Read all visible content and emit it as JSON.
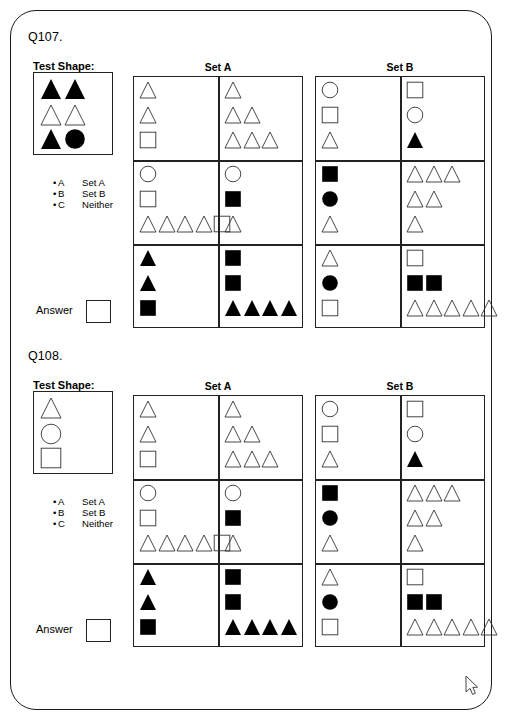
{
  "page": {
    "cursor": {
      "name": "mouse-pointer",
      "x": 466,
      "y": 676
    }
  },
  "shape_palette": {
    "outline_stroke": "#333333",
    "fill_color": "#000000"
  },
  "questions": [
    {
      "id": "q107",
      "label": "Q107.",
      "test_shape_label": "Test Shape:",
      "set_a_label": "Set A",
      "set_b_label": "Set B",
      "answer_label": "Answer",
      "options": [
        {
          "bullet": "•",
          "key": "A",
          "value": "Set A"
        },
        {
          "bullet": "•",
          "key": "B",
          "value": "Set B"
        },
        {
          "bullet": "•",
          "key": "C",
          "value": "Neither"
        }
      ],
      "test_shape_rows": [
        [
          {
            "shape": "triangle",
            "fill": "solid"
          },
          {
            "shape": "triangle",
            "fill": "solid"
          }
        ],
        [
          {
            "shape": "triangle",
            "fill": "outline"
          },
          {
            "shape": "triangle",
            "fill": "outline"
          }
        ],
        [
          {
            "shape": "triangle",
            "fill": "solid"
          },
          {
            "shape": "circle",
            "fill": "solid"
          }
        ]
      ],
      "set_a_cells": [
        [
          [
            [
              {
                "shape": "triangle",
                "fill": "outline"
              }
            ],
            [
              {
                "shape": "triangle",
                "fill": "outline"
              }
            ],
            [
              {
                "shape": "square",
                "fill": "outline"
              }
            ]
          ],
          [
            [
              {
                "shape": "triangle",
                "fill": "outline"
              }
            ],
            [
              {
                "shape": "triangle",
                "fill": "outline"
              },
              {
                "shape": "triangle",
                "fill": "outline"
              }
            ],
            [
              {
                "shape": "triangle",
                "fill": "outline"
              },
              {
                "shape": "triangle",
                "fill": "outline"
              },
              {
                "shape": "triangle",
                "fill": "outline"
              }
            ]
          ]
        ],
        [
          [
            [
              {
                "shape": "circle",
                "fill": "outline"
              }
            ],
            [
              {
                "shape": "square",
                "fill": "outline"
              }
            ],
            [
              {
                "shape": "triangle",
                "fill": "outline"
              },
              {
                "shape": "triangle",
                "fill": "outline"
              },
              {
                "shape": "triangle",
                "fill": "outline"
              },
              {
                "shape": "triangle",
                "fill": "outline"
              },
              {
                "shape": "square",
                "fill": "outline"
              }
            ]
          ],
          [
            [
              {
                "shape": "circle",
                "fill": "outline"
              }
            ],
            [
              {
                "shape": "square",
                "fill": "solid"
              }
            ],
            [
              {
                "shape": "triangle",
                "fill": "outline"
              }
            ]
          ]
        ],
        [
          [
            [
              {
                "shape": "triangle",
                "fill": "solid"
              }
            ],
            [
              {
                "shape": "triangle",
                "fill": "solid"
              }
            ],
            [
              {
                "shape": "square",
                "fill": "solid"
              }
            ]
          ],
          [
            [
              {
                "shape": "square",
                "fill": "solid"
              }
            ],
            [
              {
                "shape": "square",
                "fill": "solid"
              }
            ],
            [
              {
                "shape": "triangle",
                "fill": "solid"
              },
              {
                "shape": "triangle",
                "fill": "solid"
              },
              {
                "shape": "triangle",
                "fill": "solid"
              },
              {
                "shape": "triangle",
                "fill": "solid"
              }
            ]
          ]
        ]
      ],
      "set_b_cells": [
        [
          [
            [
              {
                "shape": "circle",
                "fill": "outline"
              }
            ],
            [
              {
                "shape": "square",
                "fill": "outline"
              }
            ],
            [
              {
                "shape": "triangle",
                "fill": "outline"
              }
            ]
          ],
          [
            [
              {
                "shape": "square",
                "fill": "outline"
              }
            ],
            [
              {
                "shape": "circle",
                "fill": "outline"
              }
            ],
            [
              {
                "shape": "triangle",
                "fill": "solid"
              }
            ]
          ]
        ],
        [
          [
            [
              {
                "shape": "square",
                "fill": "solid"
              }
            ],
            [
              {
                "shape": "circle",
                "fill": "solid"
              }
            ],
            [
              {
                "shape": "triangle",
                "fill": "outline"
              }
            ]
          ],
          [
            [
              {
                "shape": "triangle",
                "fill": "outline"
              },
              {
                "shape": "triangle",
                "fill": "outline"
              },
              {
                "shape": "triangle",
                "fill": "outline"
              }
            ],
            [
              {
                "shape": "triangle",
                "fill": "outline"
              },
              {
                "shape": "triangle",
                "fill": "outline"
              }
            ],
            [
              {
                "shape": "triangle",
                "fill": "outline"
              }
            ]
          ]
        ],
        [
          [
            [
              {
                "shape": "triangle",
                "fill": "outline"
              }
            ],
            [
              {
                "shape": "circle",
                "fill": "solid"
              }
            ],
            [
              {
                "shape": "square",
                "fill": "outline"
              }
            ]
          ],
          [
            [
              {
                "shape": "square",
                "fill": "outline"
              }
            ],
            [
              {
                "shape": "square",
                "fill": "solid"
              },
              {
                "shape": "square",
                "fill": "solid"
              }
            ],
            [
              {
                "shape": "triangle",
                "fill": "outline"
              },
              {
                "shape": "triangle",
                "fill": "outline"
              },
              {
                "shape": "triangle",
                "fill": "outline"
              },
              {
                "shape": "triangle",
                "fill": "outline"
              },
              {
                "shape": "triangle",
                "fill": "outline"
              }
            ]
          ]
        ]
      ]
    },
    {
      "id": "q108",
      "label": "Q108.",
      "test_shape_label": "Test Shape:",
      "set_a_label": "Set A",
      "set_b_label": "Set B",
      "answer_label": "Answer",
      "options": [
        {
          "bullet": "•",
          "key": "A",
          "value": "Set A"
        },
        {
          "bullet": "•",
          "key": "B",
          "value": "Set B"
        },
        {
          "bullet": "•",
          "key": "C",
          "value": "Neither"
        }
      ],
      "test_shape_rows": [
        [
          {
            "shape": "triangle",
            "fill": "outline"
          }
        ],
        [
          {
            "shape": "circle",
            "fill": "outline"
          }
        ],
        [
          {
            "shape": "square",
            "fill": "outline"
          }
        ]
      ],
      "set_a_cells": [
        [
          [
            [
              {
                "shape": "triangle",
                "fill": "outline"
              }
            ],
            [
              {
                "shape": "triangle",
                "fill": "outline"
              }
            ],
            [
              {
                "shape": "square",
                "fill": "outline"
              }
            ]
          ],
          [
            [
              {
                "shape": "triangle",
                "fill": "outline"
              }
            ],
            [
              {
                "shape": "triangle",
                "fill": "outline"
              },
              {
                "shape": "triangle",
                "fill": "outline"
              }
            ],
            [
              {
                "shape": "triangle",
                "fill": "outline"
              },
              {
                "shape": "triangle",
                "fill": "outline"
              },
              {
                "shape": "triangle",
                "fill": "outline"
              }
            ]
          ]
        ],
        [
          [
            [
              {
                "shape": "circle",
                "fill": "outline"
              }
            ],
            [
              {
                "shape": "square",
                "fill": "outline"
              }
            ],
            [
              {
                "shape": "triangle",
                "fill": "outline"
              },
              {
                "shape": "triangle",
                "fill": "outline"
              },
              {
                "shape": "triangle",
                "fill": "outline"
              },
              {
                "shape": "triangle",
                "fill": "outline"
              },
              {
                "shape": "square",
                "fill": "outline"
              }
            ]
          ],
          [
            [
              {
                "shape": "circle",
                "fill": "outline"
              }
            ],
            [
              {
                "shape": "square",
                "fill": "solid"
              }
            ],
            [
              {
                "shape": "triangle",
                "fill": "outline"
              }
            ]
          ]
        ],
        [
          [
            [
              {
                "shape": "triangle",
                "fill": "solid"
              }
            ],
            [
              {
                "shape": "triangle",
                "fill": "solid"
              }
            ],
            [
              {
                "shape": "square",
                "fill": "solid"
              }
            ]
          ],
          [
            [
              {
                "shape": "square",
                "fill": "solid"
              }
            ],
            [
              {
                "shape": "square",
                "fill": "solid"
              }
            ],
            [
              {
                "shape": "triangle",
                "fill": "solid"
              },
              {
                "shape": "triangle",
                "fill": "solid"
              },
              {
                "shape": "triangle",
                "fill": "solid"
              },
              {
                "shape": "triangle",
                "fill": "solid"
              }
            ]
          ]
        ]
      ],
      "set_b_cells": [
        [
          [
            [
              {
                "shape": "circle",
                "fill": "outline"
              }
            ],
            [
              {
                "shape": "square",
                "fill": "outline"
              }
            ],
            [
              {
                "shape": "triangle",
                "fill": "outline"
              }
            ]
          ],
          [
            [
              {
                "shape": "square",
                "fill": "outline"
              }
            ],
            [
              {
                "shape": "circle",
                "fill": "outline"
              }
            ],
            [
              {
                "shape": "triangle",
                "fill": "solid"
              }
            ]
          ]
        ],
        [
          [
            [
              {
                "shape": "square",
                "fill": "solid"
              }
            ],
            [
              {
                "shape": "circle",
                "fill": "solid"
              }
            ],
            [
              {
                "shape": "triangle",
                "fill": "outline"
              }
            ]
          ],
          [
            [
              {
                "shape": "triangle",
                "fill": "outline"
              },
              {
                "shape": "triangle",
                "fill": "outline"
              },
              {
                "shape": "triangle",
                "fill": "outline"
              }
            ],
            [
              {
                "shape": "triangle",
                "fill": "outline"
              },
              {
                "shape": "triangle",
                "fill": "outline"
              }
            ],
            [
              {
                "shape": "triangle",
                "fill": "outline"
              }
            ]
          ]
        ],
        [
          [
            [
              {
                "shape": "triangle",
                "fill": "outline"
              }
            ],
            [
              {
                "shape": "circle",
                "fill": "solid"
              }
            ],
            [
              {
                "shape": "square",
                "fill": "outline"
              }
            ]
          ],
          [
            [
              {
                "shape": "square",
                "fill": "outline"
              }
            ],
            [
              {
                "shape": "square",
                "fill": "solid"
              },
              {
                "shape": "square",
                "fill": "solid"
              }
            ],
            [
              {
                "shape": "triangle",
                "fill": "outline"
              },
              {
                "shape": "triangle",
                "fill": "outline"
              },
              {
                "shape": "triangle",
                "fill": "outline"
              },
              {
                "shape": "triangle",
                "fill": "outline"
              },
              {
                "shape": "triangle",
                "fill": "outline"
              }
            ]
          ]
        ]
      ]
    }
  ]
}
